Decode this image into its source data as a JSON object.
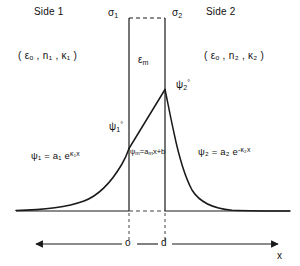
{
  "figure": {
    "regions": {
      "left": {
        "name_label": "Side 1",
        "material_label": "( εₒ , n₁ , κ₁ )",
        "wave_equation": "ψ₁ = a₁ e",
        "wave_exponent": "κ₁x"
      },
      "middle": {
        "permittivity_label": "ε",
        "permittivity_sub": "m",
        "wave_equation": "ψ",
        "wave_equation_sub": "m",
        "wave_equation_rest": "=a",
        "wave_equation_sub2": "m",
        "wave_equation_tail": "x+b"
      },
      "right": {
        "name_label": "Side 2",
        "material_label": "( εₒ , n₂ , κ₂ )",
        "wave_equation": "ψ₂ = a₂ e",
        "wave_exponent": "-κ₂x"
      }
    },
    "interfaces": {
      "sigma_left": "σ",
      "sigma_left_sub": "1",
      "sigma_right": "σ",
      "sigma_right_sub": "2"
    },
    "boundary_values": {
      "psi1_zero": "ψ",
      "psi1_zero_sub": "1",
      "psi1_zero_sup": "°",
      "psi2_zero": "ψ",
      "psi2_zero_sub": "2",
      "psi2_zero_sup": "°"
    },
    "axis": {
      "label": "x",
      "tick_origin": "o",
      "tick_thickness": "d"
    },
    "colors": {
      "line": "#1a1a1a",
      "background": "#ffffff",
      "dash": "#555555"
    }
  }
}
